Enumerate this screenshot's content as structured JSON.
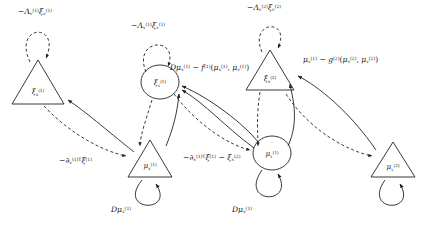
{
  "figure": {
    "type": "diagram",
    "background": "#ffffff",
    "stroke_color": "#222222",
    "width": 426,
    "height": 232
  },
  "nodes": [
    {
      "id": "xi_v_1",
      "shape": "triangle",
      "label_plain": "xi_v^(1)",
      "x": 38,
      "y": 86,
      "w": 56,
      "h": 40
    },
    {
      "id": "xi_x_1",
      "shape": "circle",
      "label_plain": "xi_x^(1)",
      "x": 160,
      "y": 82,
      "w": 38,
      "h": 34
    },
    {
      "id": "xi_v_2",
      "shape": "triangle",
      "label_plain": "xi_v^(2)",
      "x": 270,
      "y": 72,
      "w": 50,
      "h": 38
    },
    {
      "id": "mu_v_1",
      "shape": "triangle",
      "label_plain": "mu_v^(1)",
      "x": 150,
      "y": 160,
      "w": 46,
      "h": 36
    },
    {
      "id": "mu_x_1",
      "shape": "circle",
      "label_plain": "mu_x^(1)",
      "x": 272,
      "y": 153,
      "w": 38,
      "h": 34
    },
    {
      "id": "mu_x_2",
      "shape": "triangle",
      "label_plain": "mu_x^(2)",
      "x": 393,
      "y": 160,
      "w": 44,
      "h": 34
    }
  ],
  "node_labels": {
    "xi_v_1": {
      "base": "ξ",
      "sub": "v",
      "sup": "(1)"
    },
    "xi_x_1": {
      "base": "ξ",
      "sub": "x",
      "sup": "(1)"
    },
    "xi_v_2": {
      "base": "ξ",
      "sub": "v",
      "sup": "(2)"
    },
    "mu_v_1": {
      "base": "μ",
      "sub": "v",
      "sup": "(1)"
    },
    "mu_x_1": {
      "base": "μ",
      "sub": "x",
      "sup": "(1)"
    },
    "mu_x_2": {
      "base": "μ",
      "sub": "x",
      "sup": "(2)"
    }
  },
  "edge_labels": [
    {
      "id": "lambda_v_1",
      "text": "−Λ_v^(1) ξ_v^(1)",
      "x": 18,
      "y": 8,
      "anchor": "left"
    },
    {
      "id": "lambda_x_1",
      "text": "−Λ_x^(1) ξ_x^(1)",
      "x": 131,
      "y": 22,
      "anchor": "left"
    },
    {
      "id": "lambda_v_2",
      "text": "−Λ_v^(2) ξ_v^(2)",
      "x": 247,
      "y": 4,
      "anchor": "left"
    },
    {
      "id": "dmu_minus_f",
      "text": "Dμ_x^(1) − f^(1)(μ_x^(1), μ_v^(1))",
      "x": 170,
      "y": 64,
      "anchor": "left"
    },
    {
      "id": "mu_minus_g",
      "text": "μ_v^(1) − g^(2)(μ_x^(2), μ_v^(2))",
      "x": 303,
      "y": 56,
      "anchor": "left"
    },
    {
      "id": "gv_xi",
      "text": "−∂_v^(1)T ξ^(1)",
      "x": 59,
      "y": 157,
      "anchor": "left"
    },
    {
      "id": "gx_xi",
      "text": "−∂_x^(1)T ξ^(1) − ξ_x^(2)",
      "x": 183,
      "y": 154,
      "anchor": "left"
    },
    {
      "id": "dmu_v_1",
      "text": "Dμ_v^(1)",
      "x": 111,
      "y": 206,
      "anchor": "left"
    },
    {
      "id": "dmu_x_1",
      "text": "Dμ_x^(1)",
      "x": 232,
      "y": 206,
      "anchor": "left"
    }
  ],
  "edge_label_parts": {
    "lambda_v_1": [
      {
        "t": "−",
        "i": false
      },
      {
        "t": "Λ",
        "i": true,
        "sub": "v",
        "sup": "(1)"
      },
      {
        "t": "ξ",
        "i": true,
        "sub": "v",
        "sup": "(1)"
      }
    ],
    "lambda_x_1": [
      {
        "t": "−",
        "i": false
      },
      {
        "t": "Λ",
        "i": true,
        "sub": "x",
        "sup": "(1)"
      },
      {
        "t": "ξ",
        "i": true,
        "sub": "x",
        "sup": "(1)"
      }
    ],
    "lambda_v_2": [
      {
        "t": "−",
        "i": false
      },
      {
        "t": "Λ",
        "i": true,
        "sub": "v",
        "sup": "(2)"
      },
      {
        "t": "ξ",
        "i": true,
        "sub": "v",
        "sup": "(2)"
      }
    ],
    "dmu_v_1": [
      {
        "t": "D",
        "i": true
      },
      {
        "t": "μ",
        "i": true,
        "sub": "v",
        "sup": "(1)"
      }
    ],
    "dmu_x_1": [
      {
        "t": "D",
        "i": true
      },
      {
        "t": "μ",
        "i": true,
        "sub": "x",
        "sup": "(1)"
      }
    ]
  },
  "legend": {
    "triangle_meaning": "causal-state node",
    "circle_meaning": "hidden-state node",
    "solid_edge": "forward (generative) message",
    "dashed_edge": "backward (prediction-error) message"
  }
}
